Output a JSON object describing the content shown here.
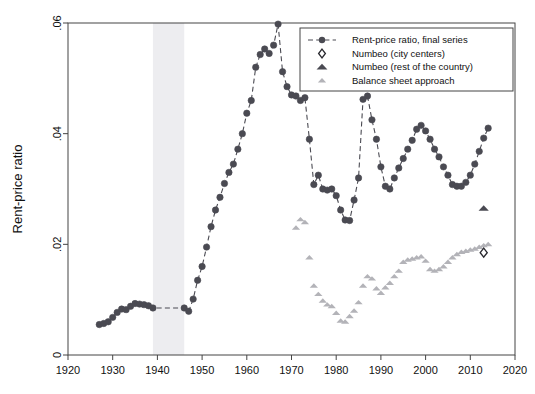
{
  "chart_data": {
    "type": "scatter",
    "title": "",
    "xlabel": "",
    "ylabel": "Rent-price ratio",
    "xlim": [
      1920,
      2020
    ],
    "ylim": [
      0,
      0.06
    ],
    "grid": false,
    "legend_position": "top-right",
    "x_ticks": [
      "1920",
      "1930",
      "1940",
      "1950",
      "1960",
      "1970",
      "1980",
      "1990",
      "2000",
      "2010",
      "2020"
    ],
    "y_ticks": [
      "0",
      ".02",
      ".04",
      ".06"
    ],
    "x_tick_values": [
      1920,
      1930,
      1940,
      1950,
      1960,
      1970,
      1980,
      1990,
      2000,
      2010,
      2020
    ],
    "y_tick_values": [
      0,
      0.02,
      0.04,
      0.06
    ],
    "shaded_band": {
      "label": "World War II",
      "x_start": 1939,
      "x_end": 1946,
      "color": "#ededf0"
    },
    "series": [
      {
        "name": "Rent-price ratio, final series",
        "marker": "circle",
        "color": "#4a4a52",
        "line": "dashed",
        "x": [
          1927,
          1928,
          1929,
          1930,
          1931,
          1932,
          1933,
          1934,
          1935,
          1936,
          1937,
          1938,
          1939,
          1946,
          1947,
          1948,
          1949,
          1950,
          1951,
          1952,
          1953,
          1954,
          1955,
          1956,
          1957,
          1958,
          1959,
          1960,
          1961,
          1962,
          1963,
          1964,
          1965,
          1966,
          1967,
          1968,
          1969,
          1970,
          1971,
          1972,
          1973,
          1974,
          1975,
          1976,
          1977,
          1978,
          1979,
          1980,
          1981,
          1982,
          1983,
          1984,
          1985,
          1986,
          1987,
          1988,
          1989,
          1990,
          1991,
          1992,
          1993,
          1994,
          1995,
          1996,
          1997,
          1998,
          1999,
          2000,
          2001,
          2002,
          2003,
          2004,
          2005,
          2006,
          2007,
          2008,
          2009,
          2010,
          2011,
          2012,
          2013,
          2014
        ],
        "y": [
          0.0055,
          0.0057,
          0.006,
          0.0068,
          0.0077,
          0.0083,
          0.0082,
          0.0088,
          0.0093,
          0.0092,
          0.0091,
          0.0089,
          0.0085,
          0.0085,
          0.0079,
          0.0101,
          0.0135,
          0.016,
          0.0195,
          0.0232,
          0.0262,
          0.0285,
          0.031,
          0.033,
          0.0345,
          0.0372,
          0.04,
          0.0437,
          0.046,
          0.052,
          0.0543,
          0.0553,
          0.0545,
          0.056,
          0.0598,
          0.0512,
          0.0485,
          0.047,
          0.0468,
          0.046,
          0.0465,
          0.039,
          0.0308,
          0.0325,
          0.03,
          0.0298,
          0.03,
          0.0288,
          0.0262,
          0.0244,
          0.0243,
          0.028,
          0.032,
          0.0462,
          0.0468,
          0.0425,
          0.039,
          0.034,
          0.0305,
          0.03,
          0.032,
          0.0338,
          0.0355,
          0.0372,
          0.0388,
          0.0408,
          0.0415,
          0.0405,
          0.039,
          0.0372,
          0.0358,
          0.034,
          0.0325,
          0.0308,
          0.0305,
          0.0305,
          0.0312,
          0.0325,
          0.0345,
          0.0368,
          0.0392,
          0.041
        ]
      },
      {
        "name": "Balance sheet approach",
        "marker": "triangle",
        "color": "#b3b3b8",
        "line": "none",
        "x": [
          1971,
          1972,
          1973,
          1974,
          1975,
          1976,
          1977,
          1978,
          1979,
          1980,
          1981,
          1982,
          1983,
          1984,
          1985,
          1986,
          1987,
          1988,
          1989,
          1990,
          1991,
          1992,
          1993,
          1994,
          1995,
          1996,
          1997,
          1998,
          1999,
          2000,
          2001,
          2002,
          2003,
          2004,
          2005,
          2006,
          2007,
          2008,
          2009,
          2010,
          2011,
          2012,
          2013,
          2014
        ],
        "y": [
          0.023,
          0.0245,
          0.024,
          0.0176,
          0.0125,
          0.011,
          0.0098,
          0.0091,
          0.0088,
          0.0076,
          0.0062,
          0.006,
          0.007,
          0.008,
          0.0095,
          0.0125,
          0.0142,
          0.0138,
          0.012,
          0.0112,
          0.0122,
          0.013,
          0.0142,
          0.0152,
          0.0168,
          0.0172,
          0.0174,
          0.0176,
          0.0178,
          0.017,
          0.0155,
          0.0152,
          0.0155,
          0.016,
          0.0168,
          0.0176,
          0.0182,
          0.0186,
          0.0188,
          0.019,
          0.0192,
          0.0195,
          0.0198,
          0.02
        ]
      },
      {
        "name": "Numbeo (city centers)",
        "marker": "diamond",
        "color": "#2a2a30",
        "line": "none",
        "x": [
          2013
        ],
        "y": [
          0.0185
        ]
      },
      {
        "name": "Numbeo (rest of the country)",
        "marker": "triangle",
        "color": "#4a4a52",
        "line": "none",
        "x": [
          2013
        ],
        "y": [
          0.0265
        ]
      }
    ],
    "legend_entries": [
      {
        "label": "Rent-price ratio, final series",
        "marker": "circle-dashed",
        "color": "#4a4a52"
      },
      {
        "label": "Numbeo (city centers)",
        "marker": "diamond",
        "color": "#2a2a30"
      },
      {
        "label": "Numbeo (rest of the country)",
        "marker": "triangle",
        "color": "#4a4a52"
      },
      {
        "label": "Balance sheet approach",
        "marker": "triangle",
        "color": "#b3b3b8"
      }
    ]
  }
}
